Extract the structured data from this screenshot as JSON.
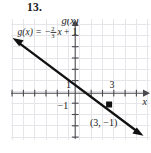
{
  "problem": {
    "number": "13."
  },
  "chart_data": {
    "type": "line",
    "title": "",
    "xlabel": "x",
    "ylabel": "g(x)",
    "equation": "g(x) = -⅔x + 1",
    "equation_parts": {
      "lhs": "g(x)",
      "equals": "=",
      "minus": "−",
      "numerator": "2",
      "denominator": "3",
      "variable": "x",
      "plus": "+",
      "intercept": "1"
    },
    "slope": -0.6666667,
    "y_intercept": 1,
    "x": [
      -6,
      6
    ],
    "y": [
      5,
      -3
    ],
    "grid": true,
    "gridline_color": "#e4e4e8",
    "axis_color": "#58585e",
    "line_color": "#1a1a1a",
    "axis_arrows": [
      "x-positive",
      "y-positive"
    ],
    "line_arrows": [
      "upper-left",
      "lower-right"
    ],
    "xlim": [
      -6,
      6
    ],
    "ylim": [
      -4,
      5
    ],
    "x_tick_labels": [
      {
        "value": 1,
        "text": "1"
      },
      {
        "value": 3,
        "text": "3"
      }
    ],
    "y_tick_labels": [
      {
        "value": -1,
        "text": "−1"
      }
    ],
    "points": [
      {
        "x": 3,
        "y": -1,
        "label": "(3, −1)",
        "style": "solid-dot"
      }
    ],
    "annotations": [
      {
        "name": "equation-label",
        "text": "g(x) = -2/3 x + 1"
      },
      {
        "name": "point-label",
        "text": "(3, −1)"
      },
      {
        "name": "y-axis-label",
        "text": "g(x)"
      },
      {
        "name": "x-axis-label",
        "text": "x"
      }
    ]
  }
}
